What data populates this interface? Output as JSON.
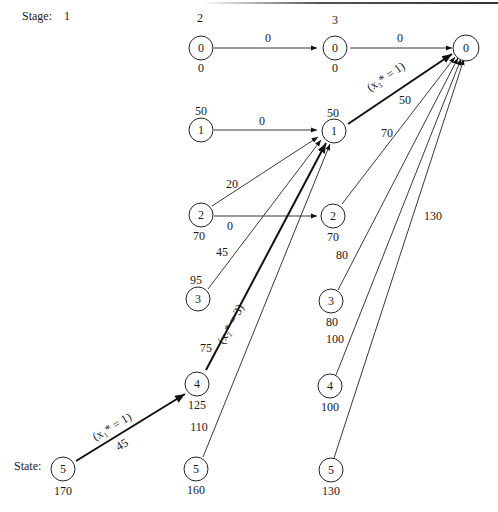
{
  "header": {
    "stage_label": "Stage:",
    "state_label": "State:",
    "stages": [
      "1",
      "2",
      "3",
      ""
    ]
  },
  "nodes": {
    "s1_5": {
      "state": "5",
      "value": "170"
    },
    "s2_0": {
      "state": "0",
      "value": "0"
    },
    "s2_1": {
      "state": "1",
      "value": "50"
    },
    "s2_2": {
      "state": "2",
      "value": "70"
    },
    "s2_3": {
      "state": "3",
      "value": "95"
    },
    "s2_4": {
      "state": "4",
      "value": "125"
    },
    "s2_5": {
      "state": "5",
      "value": "160"
    },
    "s3_0": {
      "state": "0",
      "value": "0"
    },
    "s3_1": {
      "state": "1",
      "value": "50"
    },
    "s3_2": {
      "state": "2",
      "value": "70"
    },
    "s3_3": {
      "state": "3",
      "value": "80"
    },
    "s3_4": {
      "state": "4",
      "value": "100"
    },
    "s3_5": {
      "state": "5",
      "value": "130"
    },
    "s4_0": {
      "state": "0"
    }
  },
  "edges": {
    "s1_5_to_s2_4": {
      "cost": "45",
      "decision": "(x₁* = 1)"
    },
    "s2_0_to_s3_0": {
      "cost": "0"
    },
    "s2_1_to_s3_1": {
      "cost": "0"
    },
    "s2_2_to_s3_1": {
      "cost": "20"
    },
    "s2_2_to_s3_2": {
      "cost": "0"
    },
    "s2_3_to_s3_1": {
      "cost": "45"
    },
    "s2_4_to_s3_1": {
      "cost": "75",
      "decision": "(x₂* = 3)"
    },
    "s2_5_to_s3_1": {
      "cost": "110"
    },
    "s3_0_to_s4_0": {
      "cost": "0"
    },
    "s3_1_to_s4_0": {
      "cost": "50",
      "decision": "(x₃* = 1)"
    },
    "s3_2_to_s4_0": {
      "cost": "70"
    },
    "s3_3_to_s4_0": {
      "cost": "80"
    },
    "s3_4_to_s4_0": {
      "cost": "100"
    },
    "s3_5_to_s4_0": {
      "cost": "130"
    }
  },
  "colors": {
    "stroke": "#222222",
    "background": "#ffffff"
  }
}
